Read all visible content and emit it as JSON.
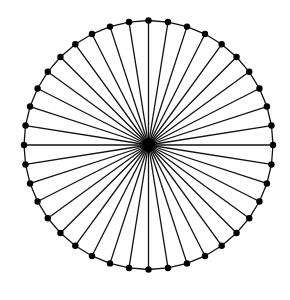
{
  "diagram": {
    "type": "wheel-graph",
    "spoke_count": 40,
    "center": {
      "x": 148.5,
      "y": 145
    },
    "radius": 124.5,
    "start_angle_deg": -90,
    "hub_radius": 7,
    "node_radius": 3.2,
    "stroke_width": 1.3,
    "colors": {
      "line": "#111111",
      "node": "#000000",
      "background": "#ffffff"
    }
  }
}
